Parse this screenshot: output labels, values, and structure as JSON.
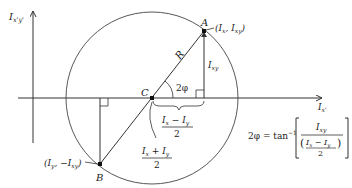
{
  "diagram": {
    "type": "Mohr's circle for moments of inertia",
    "axes": {
      "vertical_label": "I",
      "vertical_sub": "x'y'",
      "horizontal_label": "I",
      "horizontal_sub": "x'"
    },
    "points": {
      "A": {
        "label": "A",
        "coords": "(I",
        "coords_sub1": "x",
        "coords_mid": ", I",
        "coords_sub2": "xy",
        "coords_end": ")"
      },
      "B": {
        "label": "B",
        "coords": "(I",
        "coords_sub1": "y",
        "coords_mid": ", −I",
        "coords_sub2": "xy",
        "coords_end": ")"
      },
      "C": {
        "label": "C"
      }
    },
    "radius_label": "R",
    "angle_label": "2φ",
    "vertical_leg": {
      "label": "I",
      "sub": "xy"
    },
    "half_diff": {
      "num_a": "I",
      "num_a_sub": "x",
      "op": " − ",
      "num_b": "I",
      "num_b_sub": "y",
      "den": "2"
    },
    "center_pos": {
      "num_a": "I",
      "num_a_sub": "x",
      "op": " + ",
      "num_b": "I",
      "num_b_sub": "y",
      "den": "2"
    },
    "formula": {
      "lhs": "2φ = tan",
      "exp": "−1",
      "num": "I",
      "num_sub": "xy",
      "den_a": "I",
      "den_a_sub": "x",
      "den_op": " − ",
      "den_b": "I",
      "den_b_sub": "y",
      "den_two": "2"
    }
  }
}
